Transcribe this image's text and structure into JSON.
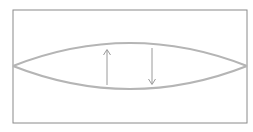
{
  "diagram": {
    "colors": {
      "frame": "#8a8a8a",
      "curve": "#b5b5b5",
      "arrow": "#9a9a9a",
      "background": "#ffffff"
    },
    "arrows": [
      {
        "direction": "up"
      },
      {
        "direction": "down"
      }
    ]
  }
}
